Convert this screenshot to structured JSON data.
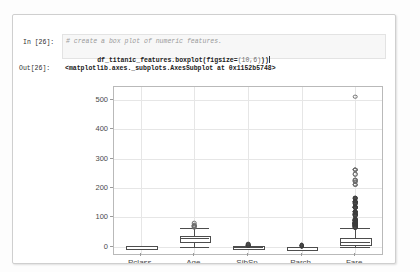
{
  "notebook": {
    "in_prompt": "In [26]:",
    "out_prompt": "Out[26]:",
    "code_comment": "# create a box plot of numeric features.",
    "code_line": "df_titanic_features.boxplot(figsize=(10,6))",
    "code_call_prefix": "df_titanic_features.boxplot(figsize=",
    "code_args": "(10,6)",
    "code_suffix": "))",
    "output_text": "<matplotlib.axes._subplots.AxesSubplot at 0x1152b5748>"
  },
  "chart_data": {
    "type": "box",
    "title": "",
    "xlabel": "",
    "ylabel": "",
    "ylim": [
      -25,
      545
    ],
    "yticks": [
      0,
      100,
      200,
      300,
      400,
      500
    ],
    "ytick_labels": [
      "0",
      "100",
      "200",
      "300",
      "400",
      "500"
    ],
    "grid": true,
    "legend": false,
    "categories": [
      "Pclass",
      "Age",
      "SibSp",
      "Parch",
      "Fare"
    ],
    "boxes": [
      {
        "name": "Pclass",
        "whisker_low": 1,
        "q1": 2,
        "median": 3,
        "q3": 3,
        "whisker_high": 3,
        "fliers": []
      },
      {
        "name": "Age",
        "whisker_low": 0.42,
        "q1": 20.1,
        "median": 28,
        "q3": 38,
        "whisker_high": 64,
        "fliers": [
          66,
          70,
          70.5,
          71,
          74,
          80
        ]
      },
      {
        "name": "SibSp",
        "whisker_low": 0,
        "q1": 0,
        "median": 0,
        "q3": 1,
        "whisker_high": 2,
        "fliers": [
          3,
          4,
          5,
          8
        ]
      },
      {
        "name": "Parch",
        "whisker_low": 0,
        "q1": 0,
        "median": 0,
        "q3": 0,
        "whisker_high": 0,
        "fliers": [
          1,
          2,
          3,
          4,
          5,
          6
        ]
      },
      {
        "name": "Fare",
        "whisker_low": 0,
        "q1": 7.9,
        "median": 14.45,
        "q3": 31,
        "whisker_high": 65,
        "fliers": [
          512.3,
          263,
          263,
          263,
          263,
          247.5,
          247.5,
          227.5,
          227.5,
          227.5,
          221.8,
          221.8,
          211.5,
          211.3,
          211.3,
          164.9,
          164.9,
          153.5,
          153.5,
          153.5,
          151.6,
          151.6,
          146.5,
          146.5,
          135.6,
          135.6,
          134.5,
          134.5,
          133.7,
          133.7,
          120,
          120,
          120,
          120,
          113.3,
          110.9,
          110.9,
          108.9,
          108.9,
          106.4,
          106.4,
          93.5,
          93.5,
          91.1,
          91.1,
          90,
          90,
          89.1,
          89.1,
          86.5,
          83.5,
          83.2,
          83.2,
          82.2,
          81.9,
          80,
          79.7,
          79.2,
          79.2,
          78.9,
          78.3,
          77.96,
          77.96,
          77.29,
          77.29,
          76.7,
          76.7,
          76.3,
          75.3,
          73.5,
          73.5,
          71.3,
          71,
          71,
          69.6,
          69.6,
          69.3,
          69.3,
          66.6,
          66.6,
          65
        ]
      }
    ]
  }
}
